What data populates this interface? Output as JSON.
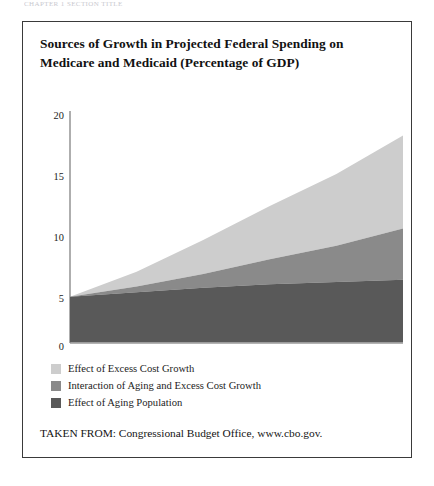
{
  "page": {
    "running_head_text": "CHAPTER 1 SECTION TITLE"
  },
  "figure": {
    "title": "Sources of Growth in Projected Federal Spending on Medicare and Medicaid (Percentage of GDP)",
    "title_line_1": "Sources of Growth in Projected Federal Spending on",
    "title_line_2": "Medicare and Medicaid (Percentage of GDP)",
    "source_label": "TAKEN FROM: Congressional Budget Office, www.cbo.gov."
  },
  "legend": {
    "items": [
      {
        "label": "Effect of Excess Cost Growth",
        "color": "#cdcdcd",
        "swatch_name": "legend-swatch-excess-cost-growth"
      },
      {
        "label": "Interaction of Aging and Excess Cost Growth",
        "color": "#8a8a8a",
        "swatch_name": "legend-swatch-interaction"
      },
      {
        "label": "Effect of Aging Population",
        "color": "#595959",
        "swatch_name": "legend-swatch-aging-population"
      }
    ]
  },
  "axes": {
    "y_ticks": [
      "20",
      "15",
      "10",
      "5",
      "0"
    ],
    "x_ticks": [
      "2007",
      "2022",
      "2037",
      "2052",
      "2067",
      "2082"
    ]
  },
  "chart_data": {
    "type": "area",
    "title": "Sources of Growth in Projected Federal Spending on Medicare and Medicaid (Percentage of GDP)",
    "xlabel": "",
    "ylabel": "Percentage of GDP",
    "stacked": true,
    "grid": false,
    "legend_position": "below-plot-left",
    "xlim": [
      2007,
      2082
    ],
    "ylim": [
      0,
      20
    ],
    "y_ticks": [
      0,
      5,
      10,
      15,
      20
    ],
    "x_ticks": [
      2007,
      2022,
      2037,
      2052,
      2067,
      2082
    ],
    "x": [
      2007,
      2022,
      2037,
      2052,
      2067,
      2082
    ],
    "series": [
      {
        "name": "Effect of Aging Population",
        "color": "#595959",
        "values": [
          4.0,
          4.4,
          4.8,
          5.1,
          5.3,
          5.5
        ]
      },
      {
        "name": "Interaction of Aging and Excess Cost Growth",
        "color": "#8a8a8a",
        "values": [
          0.0,
          0.5,
          1.2,
          2.2,
          3.2,
          4.5
        ]
      },
      {
        "name": "Effect of Excess Cost Growth",
        "color": "#cdcdcd",
        "values": [
          0.0,
          1.3,
          3.0,
          4.7,
          6.3,
          8.2
        ]
      }
    ],
    "cumulative_totals": [
      4.0,
      6.2,
      9.0,
      12.0,
      14.8,
      18.2
    ],
    "annotations": []
  }
}
